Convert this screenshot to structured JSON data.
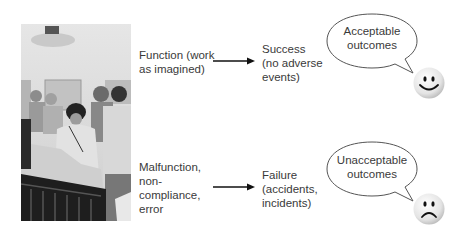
{
  "photo": {
    "description": "black-and-white photo of clinical staff around a patient bed"
  },
  "rows": [
    {
      "cause": "Function (work\nas imagined)",
      "outcome": "Success\n(no adverse\nevents)",
      "bubble": "Acceptable\noutcomes",
      "face": "smiley-face-icon"
    },
    {
      "cause": "Malfunction,\nnon-\ncompliance,\nerror",
      "outcome": "Failure\n(accidents,\nincidents)",
      "bubble": "Unacceptable\noutcomes",
      "face": "frown-face-icon"
    }
  ],
  "colors": {
    "text": "#3a3a3a",
    "arrow": "#111111",
    "bubble_stroke": "#555555"
  }
}
